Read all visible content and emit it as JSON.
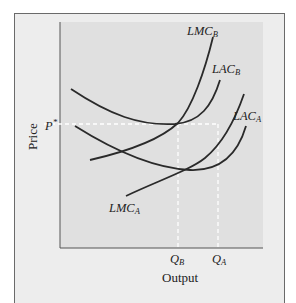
{
  "diagram": {
    "type": "economics-cost-curves",
    "axes": {
      "x_title": "Output",
      "y_title": "Price"
    },
    "price_level": {
      "label": "P",
      "sup": "*"
    },
    "quantities": [
      {
        "base": "Q",
        "sub": "B"
      },
      {
        "base": "Q",
        "sub": "A"
      }
    ],
    "curves": [
      {
        "id": "LMC_B",
        "base": "LMC",
        "sub": "B",
        "kind": "long-run marginal cost, firm B"
      },
      {
        "id": "LAC_B",
        "base": "LAC",
        "sub": "B",
        "kind": "long-run average cost, firm B"
      },
      {
        "id": "LAC_A",
        "base": "LAC",
        "sub": "A",
        "kind": "long-run average cost, firm A"
      },
      {
        "id": "LMC_A",
        "base": "LMC",
        "sub": "A",
        "kind": "long-run marginal cost, firm A"
      }
    ],
    "colors": {
      "frame_bg": "#ededed",
      "plot_bg": "#e0e0e0",
      "curve": "#2a2a2a",
      "dashed": "#ffffff",
      "axis": "#555555"
    }
  }
}
